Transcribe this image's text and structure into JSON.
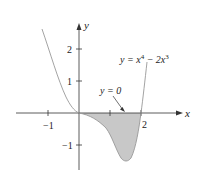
{
  "figure": {
    "axes": {
      "x_label": "x",
      "y_label": "y",
      "x_ticks": [
        {
          "value": -1,
          "label": "−1"
        },
        {
          "value": 1,
          "label": ""
        },
        {
          "value": 2,
          "label": "2"
        }
      ],
      "y_ticks": [
        {
          "value": 2,
          "label": "2"
        },
        {
          "value": 1,
          "label": "1"
        },
        {
          "value": -1,
          "label": "−1"
        }
      ]
    },
    "curve": {
      "equation_label_prefix": "y = x",
      "equation_exp1": "4",
      "equation_mid": " − 2x",
      "equation_exp2": "3",
      "color": "#999999"
    },
    "annotation": {
      "label": "y = 0"
    },
    "shaded_region": {
      "from_x": 0,
      "to_x": 2,
      "fill": "#c8c8c8"
    }
  }
}
